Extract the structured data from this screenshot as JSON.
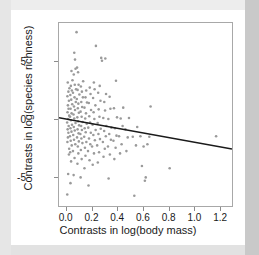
{
  "figure": {
    "background_color": "#ffffff",
    "mat_color": "#e6e6e6",
    "point_color": "#9a9a9a",
    "line_color": "#1a1a1a",
    "frame_color": "#a8a8a8"
  },
  "chart_data": {
    "type": "scatter",
    "title": "",
    "xlabel": "Contrasts in log(body mass)",
    "ylabel": "Contrasts in log(species richness)",
    "xlim": [
      -0.06,
      1.3
    ],
    "ylim": [
      -7.6,
      8.4
    ],
    "xticks": [
      0.0,
      0.2,
      0.4,
      0.6,
      0.8,
      1.0,
      1.2
    ],
    "xticklabels": [
      "0.0",
      "0.2",
      "0.4",
      "0.6",
      "0.8",
      "1.0",
      "1.2"
    ],
    "yticks": [
      5,
      0,
      -5
    ],
    "yticklabels": [
      "5",
      "0",
      "-5"
    ],
    "grid": false,
    "legend": null,
    "marker": {
      "shape": "circle",
      "size": 2.6,
      "color": "#9a9a9a"
    },
    "trendline": {
      "type": "linear-fit",
      "color": "#1a1a1a",
      "width": 1.6,
      "x_start": -0.06,
      "y_start": 0.12,
      "x_end": 1.3,
      "y_end": -2.62,
      "intercept": 0.0,
      "slope": -2.0
    },
    "points": [
      [
        0.005,
        -6.6
      ],
      [
        0.012,
        -4.8
      ],
      [
        0.018,
        -3.1
      ],
      [
        0.02,
        -2.6
      ],
      [
        0.006,
        -2.0
      ],
      [
        0.01,
        -1.6
      ],
      [
        0.014,
        -1.2
      ],
      [
        0.008,
        -0.9
      ],
      [
        0.016,
        -0.6
      ],
      [
        0.004,
        -0.3
      ],
      [
        0.012,
        0.0
      ],
      [
        0.02,
        0.3
      ],
      [
        0.007,
        0.6
      ],
      [
        0.015,
        0.9
      ],
      [
        0.01,
        1.2
      ],
      [
        0.018,
        1.6
      ],
      [
        0.006,
        2.0
      ],
      [
        0.014,
        2.4
      ],
      [
        0.022,
        2.7
      ],
      [
        0.009,
        3.2
      ],
      [
        0.03,
        -5.6
      ],
      [
        0.035,
        -3.7
      ],
      [
        0.028,
        -2.9
      ],
      [
        0.04,
        -2.3
      ],
      [
        0.032,
        -1.9
      ],
      [
        0.026,
        -1.5
      ],
      [
        0.038,
        -1.1
      ],
      [
        0.03,
        -0.8
      ],
      [
        0.042,
        -0.5
      ],
      [
        0.034,
        -0.1
      ],
      [
        0.027,
        0.2
      ],
      [
        0.039,
        0.5
      ],
      [
        0.031,
        0.9
      ],
      [
        0.044,
        1.3
      ],
      [
        0.036,
        1.7
      ],
      [
        0.029,
        2.1
      ],
      [
        0.041,
        2.5
      ],
      [
        0.033,
        2.9
      ],
      [
        0.046,
        3.4
      ],
      [
        0.038,
        4.2
      ],
      [
        0.055,
        -4.9
      ],
      [
        0.062,
        -3.4
      ],
      [
        0.05,
        -2.8
      ],
      [
        0.068,
        -2.2
      ],
      [
        0.058,
        -1.8
      ],
      [
        0.052,
        -1.4
      ],
      [
        0.064,
        -1.0
      ],
      [
        0.056,
        -0.7
      ],
      [
        0.07,
        -0.35
      ],
      [
        0.06,
        0.05
      ],
      [
        0.054,
        0.4
      ],
      [
        0.066,
        0.8
      ],
      [
        0.058,
        1.1
      ],
      [
        0.072,
        1.5
      ],
      [
        0.062,
        1.9
      ],
      [
        0.05,
        2.3
      ],
      [
        0.074,
        2.6
      ],
      [
        0.064,
        3.0
      ],
      [
        0.056,
        3.9
      ],
      [
        0.07,
        4.4
      ],
      [
        0.066,
        5.2
      ],
      [
        0.06,
        5.8
      ],
      [
        0.078,
        7.6
      ],
      [
        0.085,
        -3.9
      ],
      [
        0.092,
        -3.0
      ],
      [
        0.088,
        -2.4
      ],
      [
        0.096,
        -1.95
      ],
      [
        0.082,
        -1.6
      ],
      [
        0.094,
        -1.25
      ],
      [
        0.086,
        -0.9
      ],
      [
        0.098,
        -0.55
      ],
      [
        0.09,
        -0.2
      ],
      [
        0.084,
        0.15
      ],
      [
        0.096,
        0.55
      ],
      [
        0.088,
        0.95
      ],
      [
        0.092,
        1.35
      ],
      [
        0.08,
        1.75
      ],
      [
        0.1,
        2.15
      ],
      [
        0.086,
        2.55
      ],
      [
        0.094,
        3.0
      ],
      [
        0.09,
        4.1
      ],
      [
        0.082,
        4.5
      ],
      [
        0.11,
        -5.1
      ],
      [
        0.118,
        -3.5
      ],
      [
        0.112,
        -2.7
      ],
      [
        0.124,
        -2.1
      ],
      [
        0.116,
        -1.7
      ],
      [
        0.108,
        -1.3
      ],
      [
        0.12,
        -0.95
      ],
      [
        0.114,
        -0.6
      ],
      [
        0.126,
        -0.25
      ],
      [
        0.118,
        0.2
      ],
      [
        0.11,
        0.65
      ],
      [
        0.122,
        1.05
      ],
      [
        0.115,
        1.5
      ],
      [
        0.128,
        1.9
      ],
      [
        0.12,
        2.4
      ],
      [
        0.112,
        2.85
      ],
      [
        0.13,
        3.3
      ],
      [
        0.14,
        -4.3
      ],
      [
        0.148,
        -3.2
      ],
      [
        0.144,
        -2.5
      ],
      [
        0.155,
        -2.0
      ],
      [
        0.138,
        -1.55
      ],
      [
        0.15,
        -1.15
      ],
      [
        0.142,
        -0.8
      ],
      [
        0.158,
        -0.4
      ],
      [
        0.146,
        0.05
      ],
      [
        0.152,
        0.5
      ],
      [
        0.14,
        1.0
      ],
      [
        0.16,
        1.45
      ],
      [
        0.148,
        1.9
      ],
      [
        0.154,
        2.5
      ],
      [
        0.172,
        -5.8
      ],
      [
        0.18,
        -3.6
      ],
      [
        0.168,
        -2.8
      ],
      [
        0.186,
        -2.2
      ],
      [
        0.176,
        -1.7
      ],
      [
        0.19,
        -1.2
      ],
      [
        0.17,
        -0.75
      ],
      [
        0.184,
        -0.3
      ],
      [
        0.178,
        0.25
      ],
      [
        0.192,
        0.8
      ],
      [
        0.174,
        1.4
      ],
      [
        0.188,
        2.2
      ],
      [
        0.182,
        2.75
      ],
      [
        0.205,
        -4.0
      ],
      [
        0.215,
        -3.0
      ],
      [
        0.2,
        -2.4
      ],
      [
        0.222,
        -1.85
      ],
      [
        0.21,
        -1.4
      ],
      [
        0.228,
        -0.95
      ],
      [
        0.204,
        -0.5
      ],
      [
        0.218,
        0.0
      ],
      [
        0.212,
        0.6
      ],
      [
        0.226,
        1.2
      ],
      [
        0.208,
        1.85
      ],
      [
        0.22,
        2.6
      ],
      [
        0.214,
        3.2
      ],
      [
        0.23,
        6.4
      ],
      [
        0.245,
        -3.8
      ],
      [
        0.255,
        -2.9
      ],
      [
        0.24,
        -2.3
      ],
      [
        0.262,
        -1.75
      ],
      [
        0.25,
        -1.3
      ],
      [
        0.268,
        -0.85
      ],
      [
        0.244,
        -0.35
      ],
      [
        0.258,
        0.2
      ],
      [
        0.252,
        0.85
      ],
      [
        0.266,
        1.6
      ],
      [
        0.248,
        2.3
      ],
      [
        0.26,
        2.9
      ],
      [
        0.272,
        5.35
      ],
      [
        0.278,
        5.1
      ],
      [
        0.29,
        -3.3
      ],
      [
        0.3,
        -2.6
      ],
      [
        0.285,
        -2.0
      ],
      [
        0.308,
        -1.5
      ],
      [
        0.295,
        -1.05
      ],
      [
        0.312,
        -0.6
      ],
      [
        0.288,
        0.1
      ],
      [
        0.302,
        0.75
      ],
      [
        0.296,
        1.5
      ],
      [
        0.31,
        2.2
      ],
      [
        0.304,
        5.3
      ],
      [
        0.33,
        -5.2
      ],
      [
        0.34,
        -3.1
      ],
      [
        0.325,
        -2.4
      ],
      [
        0.348,
        -1.8
      ],
      [
        0.335,
        -1.3
      ],
      [
        0.352,
        -0.75
      ],
      [
        0.328,
        0.0
      ],
      [
        0.344,
        0.9
      ],
      [
        0.338,
        1.95
      ],
      [
        0.375,
        -3.5
      ],
      [
        0.385,
        -2.5
      ],
      [
        0.368,
        -1.9
      ],
      [
        0.392,
        -1.45
      ],
      [
        0.38,
        -0.8
      ],
      [
        0.396,
        0.15
      ],
      [
        0.372,
        0.95
      ],
      [
        0.388,
        3.35
      ],
      [
        0.42,
        -3.0
      ],
      [
        0.432,
        -2.2
      ],
      [
        0.412,
        -1.5
      ],
      [
        0.44,
        -0.6
      ],
      [
        0.425,
        0.05
      ],
      [
        0.445,
        1.0
      ],
      [
        0.47,
        -2.8
      ],
      [
        0.48,
        -1.6
      ],
      [
        0.462,
        -0.9
      ],
      [
        0.49,
        0.1
      ],
      [
        0.532,
        -6.7
      ],
      [
        0.545,
        -2.3
      ],
      [
        0.52,
        -1.55
      ],
      [
        0.555,
        -0.7
      ],
      [
        0.592,
        -4.1
      ],
      [
        0.605,
        -2.4
      ],
      [
        0.58,
        -1.5
      ],
      [
        0.615,
        -5.4
      ],
      [
        0.622,
        -5.1
      ],
      [
        0.635,
        -2.2
      ],
      [
        0.65,
        -1.55
      ],
      [
        0.66,
        1.1
      ],
      [
        0.81,
        -4.3
      ],
      [
        1.175,
        -1.5
      ]
    ]
  }
}
